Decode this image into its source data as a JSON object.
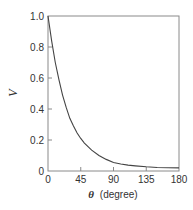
{
  "chart_data": {
    "type": "line",
    "title": "",
    "xlabel": "θ (degree)",
    "xlabel_symbol": "θ",
    "xlabel_unit": "(degree)",
    "ylabel": "V",
    "xlim": [
      0,
      180
    ],
    "ylim": [
      0,
      1.0
    ],
    "xticks": [
      0,
      45,
      90,
      135,
      180
    ],
    "xtick_labels": [
      "0",
      "45",
      "90",
      "135",
      "180"
    ],
    "yticks": [
      0,
      0.2,
      0.4,
      0.6,
      0.8,
      1.0
    ],
    "ytick_labels": [
      "0",
      "0.2",
      "0.4",
      "0.6",
      "0.8",
      "1.0"
    ],
    "grid": false,
    "legend": null,
    "series": [
      {
        "name": "V",
        "x": [
          0,
          5,
          10,
          15,
          20,
          25,
          30,
          35,
          40,
          45,
          50,
          60,
          70,
          80,
          90,
          100,
          110,
          120,
          135,
          150,
          165,
          180
        ],
        "y": [
          1.0,
          0.84,
          0.7,
          0.59,
          0.49,
          0.41,
          0.34,
          0.29,
          0.245,
          0.21,
          0.18,
          0.135,
          0.1,
          0.075,
          0.055,
          0.045,
          0.038,
          0.033,
          0.027,
          0.023,
          0.021,
          0.02
        ]
      }
    ]
  },
  "colors": {
    "axis": "#8a8a8a",
    "curve": "#444444",
    "text": "#333333"
  }
}
